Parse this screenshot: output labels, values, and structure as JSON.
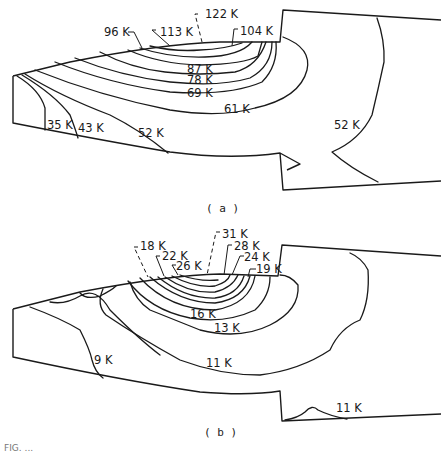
{
  "figure": {
    "caption_partial": "FIG. ...",
    "line_color": "#1a1a1a",
    "background": "#ffffff"
  },
  "panels": [
    {
      "id": "a",
      "sublabel": "( a )",
      "outline": {
        "tool_upper_left": [
          [
            40,
            76
          ],
          [
            220,
            42
          ]
        ],
        "tool_right_edge": [
          [
            280,
            42
          ],
          [
            283,
            10
          ],
          [
            441,
            20
          ]
        ],
        "lower_left_face": [
          [
            13,
            76
          ],
          [
            13,
            123
          ],
          [
            165,
            152
          ],
          [
            280,
            153
          ],
          [
            283,
            191
          ],
          [
            441,
            182
          ]
        ]
      },
      "contours": [
        {
          "value": "122 K",
          "label_xy": [
            202,
            18
          ]
        },
        {
          "value": "113 K",
          "label_xy": [
            160,
            32
          ]
        },
        {
          "value": "104 K",
          "label_xy": [
            240,
            32
          ]
        },
        {
          "value": "96 K",
          "label_xy": [
            104,
            36
          ]
        },
        {
          "value": "87 K",
          "label_xy": [
            188,
            72
          ]
        },
        {
          "value": "78 K",
          "label_xy": [
            188,
            83
          ]
        },
        {
          "value": "69 K",
          "label_xy": [
            188,
            96
          ]
        },
        {
          "value": "61 K",
          "label_xy": [
            224,
            112
          ]
        },
        {
          "value": "52 K",
          "label_xy": [
            138,
            136
          ]
        },
        {
          "value": "43 K",
          "label_xy": [
            78,
            130
          ]
        },
        {
          "value": "35 K",
          "label_xy": [
            47,
            128
          ]
        },
        {
          "value": "52 K",
          "label_xy": [
            334,
            128
          ]
        }
      ]
    },
    {
      "id": "b",
      "sublabel": "( b )",
      "contours": [
        {
          "value": "31 K",
          "label_xy": [
            224,
            235
          ]
        },
        {
          "value": "28 K",
          "label_xy": [
            234,
            248
          ]
        },
        {
          "value": "18 K",
          "label_xy": [
            140,
            249
          ]
        },
        {
          "value": "24 K",
          "label_xy": [
            244,
            259
          ]
        },
        {
          "value": "22 K",
          "label_xy": [
            162,
            258
          ]
        },
        {
          "value": "26 K",
          "label_xy": [
            176,
            268
          ]
        },
        {
          "value": "19 K",
          "label_xy": [
            256,
            272
          ]
        },
        {
          "value": "16 K",
          "label_xy": [
            190,
            317
          ]
        },
        {
          "value": "13 K",
          "label_xy": [
            216,
            331
          ]
        },
        {
          "value": "9 K",
          "label_xy": [
            94,
            363
          ]
        },
        {
          "value": "11 K",
          "label_xy": [
            208,
            366
          ]
        },
        {
          "value": "11 K",
          "label_xy": [
            336,
            410
          ]
        }
      ]
    }
  ]
}
